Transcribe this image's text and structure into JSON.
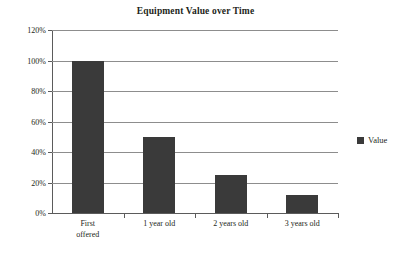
{
  "chart_data": {
    "type": "bar",
    "title": "Equipment Value over Time",
    "xlabel": "",
    "ylabel": "",
    "categories": [
      "First offered",
      "1 year old",
      "2 years old",
      "3 years old"
    ],
    "values": [
      100,
      50,
      25,
      12
    ],
    "value_unit": "%",
    "ylim": [
      0,
      120
    ],
    "ytick_labels": [
      "120%",
      "100%",
      "80%",
      "60%",
      "40%",
      "20%",
      "0%"
    ],
    "ytick_values": [
      120,
      100,
      80,
      60,
      40,
      20,
      0
    ],
    "grid": true,
    "grid_axis": "y",
    "legend_position": "right",
    "series": [
      {
        "name": "Value",
        "values": [
          100,
          50,
          25,
          12
        ],
        "color": "#3a3a3a"
      }
    ]
  },
  "legend": {
    "entries": [
      {
        "label": "Value",
        "color": "#3a3a3a"
      }
    ]
  },
  "category_labels": [
    {
      "line1": "First",
      "line2": "offered"
    },
    {
      "line1": "1 year old",
      "line2": ""
    },
    {
      "line1": "2 years old",
      "line2": ""
    },
    {
      "line1": "3 years old",
      "line2": ""
    }
  ],
  "colors": {
    "bar": "#3a3a3a",
    "gridline": "#8d8d8d",
    "axis": "#5b5b5b",
    "text": "#231f20",
    "background": "#ffffff"
  }
}
